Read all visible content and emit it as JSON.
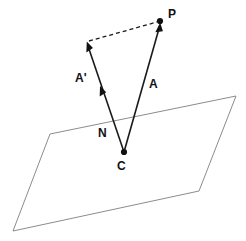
{
  "figure": {
    "background_color": "#ffffff",
    "line_color": "#1a1a1a",
    "plane_color": "#8c8c8c",
    "dot_color": "#111111"
  },
  "labels": {
    "p": "P",
    "a": "A",
    "a_prime": "A'",
    "n": "N",
    "c": "C"
  },
  "points": {
    "P": {
      "x": 160,
      "y": 21
    },
    "C": {
      "x": 124,
      "y": 152
    },
    "N": {
      "x": 112,
      "y": 122
    },
    "A_prime_tip": {
      "x": 87,
      "y": 42
    }
  },
  "label_positions": {
    "p": {
      "x": 168,
      "y": 18
    },
    "a": {
      "x": 149,
      "y": 88
    },
    "a_prime": {
      "x": 75,
      "y": 82
    },
    "n": {
      "x": 98,
      "y": 137
    },
    "c": {
      "x": 117,
      "y": 170
    }
  },
  "plane": {
    "corners": [
      {
        "x": 50,
        "y": 134
      },
      {
        "x": 236,
        "y": 96
      },
      {
        "x": 199,
        "y": 191
      },
      {
        "x": 13,
        "y": 231
      }
    ]
  },
  "vectors": [
    {
      "name": "A",
      "label": "A",
      "from": {
        "x": 124,
        "y": 152
      },
      "to": {
        "x": 159,
        "y": 24
      },
      "style": "solid",
      "arrow": "end"
    },
    {
      "name": "A-prime",
      "label": "A'",
      "from": {
        "x": 124,
        "y": 152
      },
      "to": {
        "x": 87,
        "y": 42
      },
      "style": "solid",
      "arrow": "end-and-mid"
    },
    {
      "name": "closure",
      "label": "",
      "from": {
        "x": 88,
        "y": 41
      },
      "to": {
        "x": 158,
        "y": 21
      },
      "style": "dashed",
      "arrow": "none"
    }
  ]
}
